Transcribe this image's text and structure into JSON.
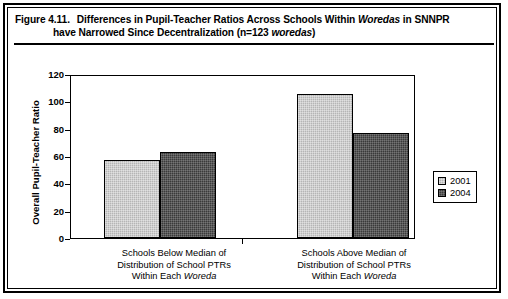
{
  "figure": {
    "number": "Figure 4.11.",
    "title_line1_a": "Differences in Pupil-Teacher Ratios Across Schools Within ",
    "title_line1_italic": "Woredas",
    "title_line1_b": " in SNNPR",
    "title_line2_a": "have Narrowed Since Decentralization (n=123 ",
    "title_line2_italic": "woredas",
    "title_line2_b": ")"
  },
  "colors": {
    "series_2001": "#b5b5b5",
    "series_2004": "#3a3a3a",
    "axis": "#000000",
    "background": "#ffffff"
  },
  "legend": {
    "position": "right",
    "entries": [
      {
        "label": "2001",
        "color": "#b5b5b5"
      },
      {
        "label": "2004",
        "color": "#3a3a3a"
      }
    ]
  },
  "chart_data": {
    "type": "bar",
    "title": "Differences in Pupil-Teacher Ratios Across Schools Within Woredas in SNNPR have Narrowed Since Decentralization (n=123 woredas)",
    "xlabel": "",
    "ylabel": "Overall Pupil-Teacher Ratio",
    "ylim": [
      0,
      120
    ],
    "yticks": [
      0,
      20,
      40,
      60,
      80,
      100,
      120
    ],
    "ytick_labels": [
      "0",
      "20",
      "40",
      "60",
      "80",
      "100",
      "120"
    ],
    "grid": false,
    "legend_position": "right",
    "categories": [
      "Schools Below Median of Distribution of School PTRs Within Each Woreda",
      "Schools Above Median of Distribution of School PTRs Within Each Woreda"
    ],
    "category_lines": [
      [
        "Schools Below Median of",
        "Distribution of School PTRs",
        "Within Each ",
        "Woreda"
      ],
      [
        "Schools Above Median of",
        "Distribution of School PTRs",
        "Within Each ",
        "Woreda"
      ]
    ],
    "series": [
      {
        "name": "2001",
        "color": "#b5b5b5",
        "values": [
          58,
          107
        ]
      },
      {
        "name": "2004",
        "color": "#3a3a3a",
        "values": [
          64,
          78
        ]
      }
    ]
  },
  "axis": {
    "y_title": "Overall Pupil-Teacher Ratio"
  }
}
